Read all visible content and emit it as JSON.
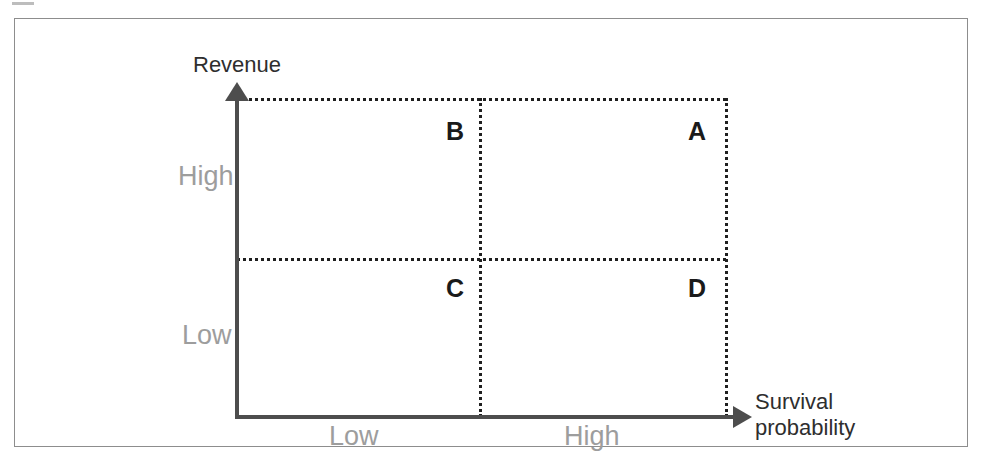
{
  "figure": {
    "width": 982,
    "height": 461,
    "background": "#ffffff",
    "frame_color": "#8d8d8d"
  },
  "chart_data": {
    "type": "scatter",
    "title": "",
    "subtitle": "",
    "xlabel": "Survival probability",
    "ylabel": "Revenue",
    "xlabel_lines": [
      "Survival",
      "probability"
    ],
    "grid": true,
    "grid_style": "dotted",
    "legend": "none",
    "axis_style": "arrow",
    "x_tick_labels": [
      "Low",
      "High"
    ],
    "y_tick_labels": [
      "Low",
      "High"
    ],
    "xlim": [
      "Low",
      "High"
    ],
    "ylim": [
      "Low",
      "High"
    ],
    "categories": [
      "A",
      "B",
      "C",
      "D"
    ],
    "quadrants": [
      {
        "id": "B",
        "label": "B",
        "x": "Low",
        "y": "High",
        "position": "top-left"
      },
      {
        "id": "A",
        "label": "A",
        "x": "High",
        "y": "High",
        "position": "top-right"
      },
      {
        "id": "C",
        "label": "C",
        "x": "Low",
        "y": "Low",
        "position": "bottom-left"
      },
      {
        "id": "D",
        "label": "D",
        "x": "High",
        "y": "Low",
        "position": "bottom-right"
      }
    ],
    "annotations": [
      {
        "text": "Revenue",
        "role": "y-axis-title"
      },
      {
        "text": "Survival probability",
        "role": "x-axis-title"
      }
    ]
  },
  "axes": {
    "y_title": "Revenue",
    "x_title_line1": "Survival",
    "x_title_line2": "probability",
    "y_high": "High",
    "y_low": "Low",
    "x_low": "Low",
    "x_high": "High",
    "title_color": "#2e2e2e",
    "tick_color": "#9d9d9d",
    "line_color": "#4d4d4d"
  },
  "quadrant_labels": {
    "top_left": "B",
    "top_right": "A",
    "bottom_left": "C",
    "bottom_right": "D",
    "color": "#1a1a1a"
  },
  "grid": {
    "dash_color": "#1f1f1f",
    "style": "dotted"
  }
}
